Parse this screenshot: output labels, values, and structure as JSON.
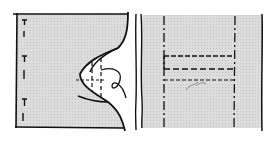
{
  "figure": {
    "colors": {
      "fill": "#d9d9d9",
      "ink": "#111111",
      "background": "#ffffff"
    },
    "left_panel": {
      "label": "Pattern piece with curved edge and marked fold line"
    },
    "right_panel": {
      "label": "Folded strip with dashed stitch rectangle",
      "handwritten_mark": "~70~"
    }
  }
}
